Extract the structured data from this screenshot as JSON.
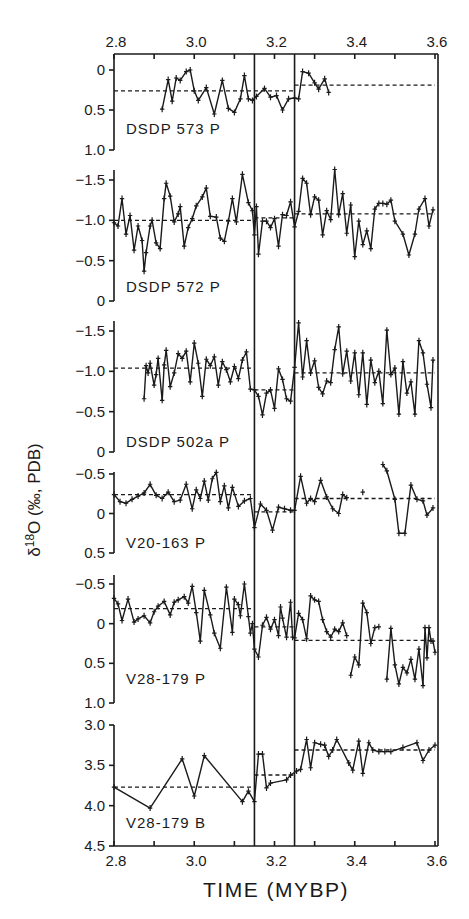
{
  "chart_data": {
    "type": "line",
    "title": "",
    "xlabel": "TIME (MYBP)",
    "ylabel": "δ18O (‰, PDB)",
    "ylabel_parts": {
      "delta": "δ",
      "sup": "18",
      "rest": "O (‰, PDB)"
    },
    "xlim": [
      2.8,
      3.6
    ],
    "x_ticks": [
      2.8,
      3.0,
      3.2,
      3.4,
      3.6
    ],
    "x_tick_labels": [
      "2.8",
      "3.0",
      "3.2",
      "3.4",
      "3.6"
    ],
    "x_minor_ticks": [
      2.9,
      3.1,
      3.3,
      3.5
    ],
    "vertical_reference_lines": [
      3.15,
      3.25
    ],
    "grid": false,
    "legend": null,
    "panels": [
      {
        "label": "DSDP 573 P",
        "ylim": [
          0,
          1.0
        ],
        "y_inverted": true,
        "y_ticks": [
          0,
          0.5,
          1.0
        ],
        "y_tick_labels": [
          "0",
          "0.5",
          "1.0"
        ],
        "means": [
          {
            "x0": 2.8,
            "x1": 3.25,
            "y": 0.26
          },
          {
            "x0": 3.25,
            "x1": 3.6,
            "y": 0.19
          }
        ],
        "x": [
          2.92,
          2.935,
          2.945,
          2.955,
          2.965,
          2.98,
          2.99,
          3.0,
          3.01,
          3.03,
          3.05,
          3.07,
          3.085,
          3.1,
          3.115,
          3.125,
          3.135,
          3.145,
          3.155,
          3.175,
          3.19,
          3.205,
          3.22,
          3.235,
          3.25,
          3.26,
          3.27,
          3.285,
          3.3,
          3.31,
          3.325,
          3.335
        ],
        "y": [
          0.49,
          0.12,
          0.39,
          0.1,
          0.13,
          0.02,
          0.0,
          0.26,
          0.38,
          0.22,
          0.55,
          0.13,
          0.48,
          0.53,
          0.36,
          0.07,
          0.36,
          0.38,
          0.33,
          0.23,
          0.34,
          0.32,
          0.5,
          0.36,
          0.35,
          0.36,
          0.02,
          0.04,
          0.16,
          0.24,
          0.11,
          0.28
        ]
      },
      {
        "label": "DSDP 572 P",
        "ylim": [
          -1.6,
          0
        ],
        "y_inverted": false,
        "y_ticks": [
          -1.5,
          -1.0,
          -0.5,
          0
        ],
        "y_tick_labels": [
          "-1.5",
          "-1.0",
          "-0.5",
          "0"
        ],
        "means": [
          {
            "x0": 2.8,
            "x1": 3.15,
            "y": -1.0
          },
          {
            "x0": 3.15,
            "x1": 3.25,
            "y": -1.03
          },
          {
            "x0": 3.25,
            "x1": 3.6,
            "y": -1.08
          }
        ],
        "x": [
          2.8,
          2.81,
          2.82,
          2.83,
          2.84,
          2.85,
          2.86,
          2.87,
          2.875,
          2.88,
          2.89,
          2.895,
          2.905,
          2.915,
          2.925,
          2.93,
          2.94,
          2.95,
          2.96,
          2.965,
          2.975,
          2.985,
          2.995,
          3.005,
          3.02,
          3.03,
          3.04,
          3.055,
          3.065,
          3.075,
          3.085,
          3.095,
          3.105,
          3.12,
          3.135,
          3.145,
          3.15,
          3.155,
          3.16,
          3.17,
          3.18,
          3.19,
          3.2,
          3.21,
          3.22,
          3.23,
          3.24,
          3.25,
          3.26,
          3.27,
          3.28,
          3.29,
          3.3,
          3.31,
          3.32,
          3.33,
          3.34,
          3.35,
          3.36,
          3.37,
          3.38,
          3.39,
          3.4,
          3.41,
          3.42,
          3.43,
          3.44,
          3.45,
          3.46,
          3.47,
          3.48,
          3.49,
          3.5,
          3.52,
          3.535,
          3.55,
          3.56,
          3.575,
          3.585,
          3.595
        ],
        "y": [
          -0.97,
          -0.93,
          -1.27,
          -0.83,
          -1.06,
          -0.63,
          -0.93,
          -0.75,
          -0.37,
          -0.6,
          -0.93,
          -1.0,
          -0.72,
          -0.65,
          -1.27,
          -1.46,
          -1.3,
          -0.98,
          -1.08,
          -1.17,
          -0.68,
          -0.91,
          -1.02,
          -1.18,
          -1.29,
          -1.4,
          -1.05,
          -1.04,
          -0.78,
          -0.74,
          -0.99,
          -1.27,
          -0.98,
          -1.57,
          -1.22,
          -1.12,
          -0.82,
          -1.17,
          -0.58,
          -0.99,
          -0.99,
          -0.91,
          -1.02,
          -0.68,
          -1.07,
          -1.06,
          -1.23,
          -0.92,
          -1.11,
          -1.52,
          -1.46,
          -1.07,
          -1.29,
          -1.25,
          -0.82,
          -1.12,
          -1.01,
          -1.63,
          -1.07,
          -1.33,
          -0.84,
          -1.19,
          -0.55,
          -0.99,
          -0.7,
          -0.87,
          -0.65,
          -1.14,
          -1.21,
          -1.21,
          -1.2,
          -1.25,
          -0.99,
          -0.83,
          -0.57,
          -0.83,
          -1.14,
          -1.27,
          -0.93,
          -1.13
        ]
      },
      {
        "label": "DSDP 502a P",
        "ylim": [
          -1.6,
          0
        ],
        "y_inverted": false,
        "y_ticks": [
          -1.5,
          -1.0,
          -0.5,
          0
        ],
        "y_tick_labels": [
          "-1.5",
          "-1.0",
          "-0.5",
          "0"
        ],
        "means": [
          {
            "x0": 2.8,
            "x1": 3.15,
            "y": -1.04
          },
          {
            "x0": 3.15,
            "x1": 3.25,
            "y": -0.77
          },
          {
            "x0": 3.25,
            "x1": 3.6,
            "y": -0.98
          }
        ],
        "x": [
          2.875,
          2.88,
          2.885,
          2.89,
          2.9,
          2.905,
          2.91,
          2.92,
          2.925,
          2.93,
          2.94,
          2.95,
          2.96,
          2.97,
          2.98,
          2.99,
          3.0,
          3.01,
          3.02,
          3.03,
          3.04,
          3.05,
          3.06,
          3.07,
          3.08,
          3.09,
          3.1,
          3.11,
          3.12,
          3.13,
          3.14,
          3.15,
          3.16,
          3.17,
          3.18,
          3.19,
          3.2,
          3.21,
          3.22,
          3.23,
          3.24,
          3.25,
          3.26,
          3.27,
          3.28,
          3.29,
          3.3,
          3.31,
          3.32,
          3.33,
          3.34,
          3.35,
          3.36,
          3.37,
          3.38,
          3.39,
          3.4,
          3.41,
          3.42,
          3.43,
          3.44,
          3.45,
          3.46,
          3.47,
          3.48,
          3.49,
          3.5,
          3.51,
          3.52,
          3.53,
          3.54,
          3.55,
          3.56,
          3.57,
          3.58,
          3.59,
          3.595
        ],
        "y": [
          -0.66,
          -1.07,
          -0.98,
          -1.1,
          -0.83,
          -0.96,
          -1.16,
          -0.64,
          -1.08,
          -1.26,
          -0.81,
          -0.98,
          -1.22,
          -1.16,
          -1.25,
          -0.87,
          -1.35,
          -1.1,
          -0.69,
          -1.15,
          -1.07,
          -1.18,
          -0.83,
          -1.12,
          -1.02,
          -0.87,
          -1.06,
          -0.91,
          -1.14,
          -1.24,
          -0.78,
          -0.77,
          -0.69,
          -0.46,
          -0.73,
          -0.77,
          -0.54,
          -1.03,
          -0.9,
          -0.66,
          -0.63,
          -1.05,
          -1.6,
          -0.93,
          -1.38,
          -0.98,
          -1.13,
          -0.8,
          -0.72,
          -0.88,
          -0.86,
          -1.27,
          -1.55,
          -0.97,
          -1.25,
          -0.88,
          -1.23,
          -0.71,
          -1.23,
          -0.59,
          -1.14,
          -0.86,
          -1.0,
          -0.6,
          -1.51,
          -0.96,
          -1.04,
          -0.47,
          -1.12,
          -0.73,
          -0.87,
          -0.47,
          -1.38,
          -1.23,
          -0.84,
          -0.55,
          -1.14
        ]
      },
      {
        "label": "V20-163 P",
        "ylim": [
          -0.55,
          0.5
        ],
        "y_inverted": true,
        "y_ticks": [
          -0.5,
          0,
          0.5
        ],
        "y_tick_labels": [
          "-0.5",
          "0",
          "0.5"
        ],
        "means": [
          {
            "x0": 2.8,
            "x1": 3.15,
            "y": -0.24
          },
          {
            "x0": 3.15,
            "x1": 3.25,
            "y": -0.02
          },
          {
            "x0": 3.25,
            "x1": 3.6,
            "y": -0.19
          }
        ],
        "x": [
          2.8,
          2.815,
          2.83,
          2.845,
          2.86,
          2.875,
          2.89,
          2.905,
          2.92,
          2.935,
          2.95,
          2.965,
          2.98,
          2.995,
          3.005,
          3.015,
          3.025,
          3.035,
          3.045,
          3.055,
          3.065,
          3.075,
          3.085,
          3.095,
          3.11,
          3.125,
          3.14,
          3.15,
          3.165,
          3.18,
          3.195,
          3.21,
          3.225,
          3.24,
          3.25,
          3.265,
          3.28,
          3.29,
          3.3,
          3.315,
          3.33,
          3.345,
          3.36,
          3.37,
          3.38
        ],
        "y": [
          -0.24,
          -0.15,
          -0.13,
          -0.18,
          -0.22,
          -0.26,
          -0.37,
          -0.23,
          -0.19,
          -0.27,
          -0.15,
          -0.17,
          -0.37,
          -0.06,
          -0.3,
          -0.19,
          -0.41,
          -0.17,
          -0.44,
          -0.52,
          -0.15,
          -0.35,
          -0.07,
          -0.33,
          -0.09,
          -0.16,
          -0.19,
          0.18,
          -0.12,
          -0.04,
          0.21,
          -0.08,
          -0.06,
          -0.04,
          -0.04,
          -0.47,
          -0.13,
          -0.19,
          -0.15,
          -0.42,
          -0.21,
          -0.06,
          0.0,
          -0.24,
          -0.2
        ],
        "extra_segments": [
          {
            "x": [
              3.42
            ],
            "y": [
              -0.27
            ]
          },
          {
            "x": [
              3.47,
              3.48,
              3.5,
              3.51,
              3.525,
              3.54,
              3.555,
              3.57,
              3.58,
              3.595
            ],
            "y": [
              -0.62,
              -0.54,
              -0.18,
              0.25,
              0.25,
              -0.36,
              -0.18,
              -0.16,
              0.02,
              -0.07
            ]
          }
        ]
      },
      {
        "label": "V28-179 P",
        "ylim": [
          -0.55,
          1.0
        ],
        "y_inverted": true,
        "y_ticks": [
          -0.5,
          0,
          0.5,
          1.0
        ],
        "y_tick_labels": [
          "-0.5",
          "0",
          "0.5",
          "1.0"
        ],
        "means": [
          {
            "x0": 2.8,
            "x1": 3.15,
            "y": -0.19
          },
          {
            "x0": 3.15,
            "x1": 3.25,
            "y": 0.04
          },
          {
            "x0": 3.25,
            "x1": 3.6,
            "y": 0.21
          }
        ],
        "x": [
          2.8,
          2.81,
          2.82,
          2.835,
          2.85,
          2.86,
          2.875,
          2.89,
          2.9,
          2.91,
          2.925,
          2.94,
          2.95,
          2.96,
          2.975,
          2.985,
          2.995,
          3.005,
          3.015,
          3.025,
          3.04,
          3.05,
          3.065,
          3.08,
          3.095,
          3.1,
          3.11,
          3.115,
          3.125,
          3.135,
          3.14,
          3.145,
          3.15,
          3.16,
          3.17,
          3.18,
          3.19,
          3.2,
          3.21,
          3.215,
          3.22,
          3.23,
          3.24,
          3.245,
          3.25,
          3.26,
          3.27,
          3.28,
          3.29,
          3.3,
          3.31,
          3.32,
          3.33,
          3.34,
          3.35,
          3.36,
          3.37,
          3.38
        ],
        "y": [
          -0.32,
          -0.25,
          -0.04,
          -0.31,
          -0.02,
          -0.06,
          -0.1,
          -0.01,
          -0.15,
          -0.22,
          -0.28,
          -0.11,
          -0.27,
          -0.3,
          -0.34,
          -0.26,
          -0.47,
          -0.14,
          0.22,
          -0.42,
          -0.11,
          0.12,
          0.31,
          -0.46,
          0.11,
          -0.31,
          -0.24,
          -0.1,
          -0.5,
          -0.09,
          0.12,
          0.0,
          0.32,
          0.42,
          0.02,
          -0.08,
          0.07,
          -0.05,
          0.15,
          -0.21,
          -0.07,
          0.17,
          -0.27,
          0.17,
          0.18,
          -0.13,
          -0.05,
          0.19,
          -0.35,
          -0.3,
          -0.28,
          -0.05,
          0.1,
          0.17,
          0.07,
          0.1,
          -0.01,
          0.15
        ],
        "extra_segments": [
          {
            "x": [
              3.39,
              3.4,
              3.41,
              3.42,
              3.43,
              3.44,
              3.45,
              3.46
            ],
            "y": [
              0.65,
              0.42,
              0.52,
              -0.26,
              -0.14,
              0.25,
              0.05,
              0.04
            ]
          },
          {
            "x": [
              3.48,
              3.49,
              3.5,
              3.51,
              3.52,
              3.53,
              3.54,
              3.55,
              3.56,
              3.57,
              3.575,
              3.58,
              3.585,
              3.59,
              3.595,
              3.6
            ],
            "y": [
              0.7,
              0.06,
              0.52,
              0.76,
              0.55,
              0.62,
              0.45,
              0.7,
              0.32,
              0.78,
              0.05,
              0.43,
              0.05,
              0.22,
              0.22,
              0.36
            ]
          }
        ]
      },
      {
        "label": "V28-179 B",
        "ylim": [
          3.0,
          4.5
        ],
        "y_inverted": true,
        "y_ticks": [
          3.0,
          3.5,
          4.0,
          4.5
        ],
        "y_tick_labels": [
          "3.0",
          "3.5",
          "4.0",
          "4.5"
        ],
        "means": [
          {
            "x0": 2.8,
            "x1": 3.15,
            "y": 3.77
          },
          {
            "x0": 3.15,
            "x1": 3.25,
            "y": 3.62
          },
          {
            "x0": 3.25,
            "x1": 3.6,
            "y": 3.31
          }
        ],
        "x": [
          2.8,
          2.89,
          2.97,
          3.0,
          3.025,
          3.12,
          3.135,
          3.15,
          3.16,
          3.17,
          3.18,
          3.19,
          3.23,
          3.24,
          3.255,
          3.265,
          3.28,
          3.29,
          3.3,
          3.315,
          3.325,
          3.335,
          3.345,
          3.355,
          3.385,
          3.395,
          3.41,
          3.42,
          3.435,
          3.445,
          3.46,
          3.475,
          3.49,
          3.52,
          3.555,
          3.57,
          3.585,
          3.6
        ],
        "y": [
          3.77,
          4.03,
          3.42,
          3.88,
          3.38,
          3.95,
          3.82,
          3.95,
          3.36,
          3.36,
          3.78,
          3.72,
          3.68,
          3.62,
          3.57,
          3.55,
          3.18,
          3.53,
          3.22,
          3.24,
          3.25,
          3.39,
          3.31,
          3.18,
          3.47,
          3.56,
          3.2,
          3.6,
          3.22,
          3.31,
          3.33,
          3.33,
          3.33,
          3.28,
          3.22,
          3.44,
          3.31,
          3.25
        ]
      }
    ]
  },
  "layout": {
    "x_to_px": {
      "x0": 2.8,
      "px0": 114,
      "x1": 3.6,
      "px1": 435
    },
    "frame": {
      "left": 114,
      "right": 438,
      "top": 54,
      "bottom": 846
    },
    "panel_px": [
      {
        "vals": [
          0,
          1.0
        ],
        "px": [
          70,
          150
        ],
        "axis_top": 54,
        "axis_bottom": 150,
        "label_y": 134
      },
      {
        "vals": [
          -1.5,
          0
        ],
        "px": [
          180,
          301
        ],
        "axis_top": 170,
        "axis_bottom": 301,
        "label_y": 292
      },
      {
        "vals": [
          -1.5,
          0
        ],
        "px": [
          331,
          452
        ],
        "axis_top": 321,
        "axis_bottom": 452,
        "label_y": 447
      },
      {
        "vals": [
          -0.5,
          0.5
        ],
        "px": [
          474,
          553
        ],
        "axis_top": 472,
        "axis_bottom": 553,
        "label_y": 548
      },
      {
        "vals": [
          -0.5,
          1.0
        ],
        "px": [
          584,
          703
        ],
        "axis_top": 575,
        "axis_bottom": 703,
        "label_y": 684
      },
      {
        "vals": [
          3.0,
          4.5
        ],
        "px": [
          725,
          846
        ],
        "axis_top": 725,
        "axis_bottom": 846,
        "label_y": 828
      }
    ],
    "top_tick_label_y": 47,
    "bottom_tick_label_y": 866,
    "xlabel_y": 897,
    "ylabel_x": 40,
    "ylabel_y": 500
  }
}
